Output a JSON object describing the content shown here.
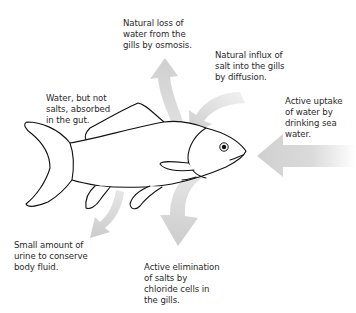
{
  "diagram": {
    "colors": {
      "arrow": "#d4d4d4",
      "outline": "#111111",
      "text": "#2a2a2a",
      "background": "#ffffff"
    },
    "labels": [
      {
        "id": "loss-water",
        "text": "Natural loss of\nwater from the\ngills by osmosis."
      },
      {
        "id": "influx-salt",
        "text": "Natural influx of\nsalt into the gills\nby diffusion."
      },
      {
        "id": "water-absorbed",
        "text": "Water, but not\nsalts, absorbed\nin the gut."
      },
      {
        "id": "drinking",
        "text": "Active uptake\nof water by\ndrinking sea\nwater."
      },
      {
        "id": "urine",
        "text": "Small amount of\nurine to conserve\nbody fluid."
      },
      {
        "id": "salt-elimination",
        "text": "Active elimination\nof salts by\nchloride cells in\nthe gills."
      }
    ],
    "arrows": [
      {
        "id": "arrow-water-loss",
        "direction": "up-out-of-gills"
      },
      {
        "id": "arrow-salt-influx",
        "direction": "down-into-gills"
      },
      {
        "id": "arrow-drinking",
        "direction": "left-into-mouth"
      },
      {
        "id": "arrow-gut",
        "direction": "curve-up-inside-body"
      },
      {
        "id": "arrow-urine",
        "direction": "down-out-of-vent"
      },
      {
        "id": "arrow-salt-elimination",
        "direction": "down-out-of-gills"
      }
    ]
  }
}
